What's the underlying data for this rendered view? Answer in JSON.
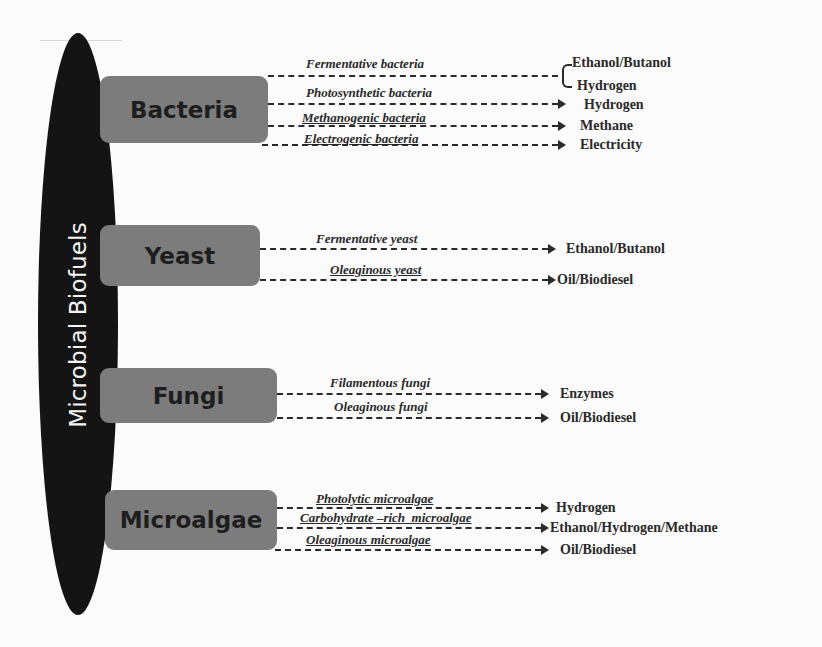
{
  "diagram": {
    "title": "Microbial Biofuels",
    "colors": {
      "ellipse": "#141414",
      "category_box": "#7c7c7c",
      "text": "#2a2a2a",
      "ellipse_text": "#f4f4f4"
    },
    "categories": [
      {
        "name": "Bacteria",
        "pathways": [
          {
            "label": "Fermentative bacteria",
            "products": [
              "Ethanol/Butanol",
              "Hydrogen"
            ]
          },
          {
            "label": "Photosynthetic bacteria",
            "products": [
              "Hydrogen"
            ]
          },
          {
            "label": "Methanogenic bacteria",
            "products": [
              "Methane"
            ]
          },
          {
            "label": "Electrogenic bacteria",
            "products": [
              "Electricity"
            ]
          }
        ]
      },
      {
        "name": "Yeast",
        "pathways": [
          {
            "label": "Fermentative yeast",
            "products": [
              "Ethanol/Butanol"
            ]
          },
          {
            "label": "Oleaginous yeast",
            "products": [
              "Oil/Biodiesel"
            ]
          }
        ]
      },
      {
        "name": "Fungi",
        "pathways": [
          {
            "label": "Filamentous fungi",
            "products": [
              "Enzymes"
            ]
          },
          {
            "label": "Oleaginous fungi",
            "products": [
              "Oil/Biodiesel"
            ]
          }
        ]
      },
      {
        "name": "Microalgae",
        "pathways": [
          {
            "label": "Photolytic microalgae",
            "products": [
              "Hydrogen"
            ]
          },
          {
            "label": "Carbohydrate –rich  microalgae",
            "products": [
              "Ethanol/Hydrogen/Methane"
            ]
          },
          {
            "label": "Oleaginous microalgae",
            "products": [
              "Oil/Biodiesel"
            ]
          }
        ]
      }
    ]
  }
}
